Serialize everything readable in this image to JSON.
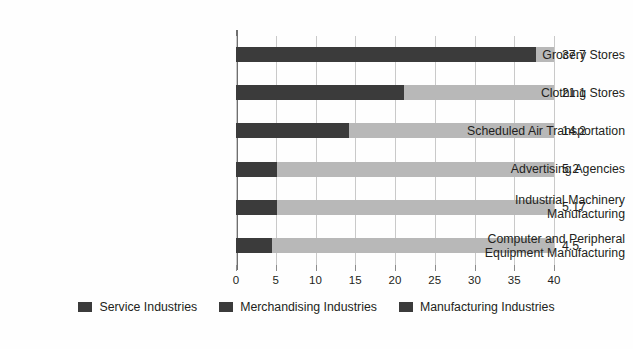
{
  "chart_data": {
    "type": "bar",
    "orientation": "horizontal",
    "title": "",
    "xlabel": "",
    "ylabel": "",
    "grid": true,
    "xlim": [
      0,
      40
    ],
    "xticks": [
      0,
      5,
      10,
      15,
      20,
      25,
      30,
      35,
      40
    ],
    "xtick_labels": [
      "0",
      "5",
      "10",
      "15",
      "20",
      "25",
      "30",
      "35",
      "40"
    ],
    "categories": [
      "Grocery Stores",
      "Clothing Stores",
      "Scheduled Air Transportation",
      "Advertising Agencies",
      "Industrial Machinery\nManufacturing",
      "Computer and Peripheral\nEquipment Manufacturing"
    ],
    "values": [
      37.7,
      21.1,
      14.2,
      5.2,
      5.17,
      4.5
    ],
    "value_labels": [
      "37.7",
      "21.1",
      "14.2",
      "5.2",
      "5.17",
      "4.5"
    ],
    "legend_position": "bottom",
    "legend": [
      "Service Industries",
      "Merchandising Industries",
      "Manufacturing Industries"
    ],
    "colors": {
      "value_segment": "#3b3b3b",
      "remainder_segment": "#b8b8b8",
      "gridline": "#c9c9c9",
      "axis": "#6f6f6f",
      "text": "#231f20",
      "background": "#fefefe"
    }
  }
}
